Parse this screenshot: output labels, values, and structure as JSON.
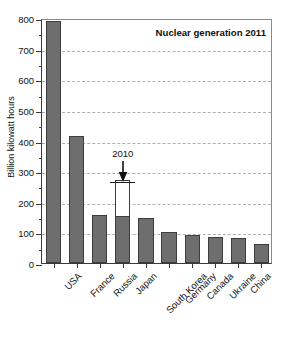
{
  "chart_data": {
    "type": "bar",
    "title": "Nuclear generation 2011",
    "xlabel": "",
    "ylabel": "Billion kilowatt hours",
    "ylim": [
      0,
      800
    ],
    "ytick_step": 100,
    "yminor_step": 50,
    "grid": true,
    "legend": "none",
    "categories": [
      "USA",
      "France",
      "Russia",
      "Japan",
      "South Korea",
      "Germany",
      "Canada",
      "Ukraine",
      "China",
      "United Kingdom"
    ],
    "values": [
      790,
      415,
      158,
      152,
      148,
      102,
      90,
      85,
      83,
      62
    ],
    "ytick_labels": [
      "0",
      "100",
      "200",
      "300",
      "400",
      "500",
      "600",
      "700",
      "800"
    ],
    "annotations": [
      {
        "label": "2010",
        "category": "Japan",
        "value": 270,
        "note": "hollow bar outline showing Japan 2010 level with downward arrow"
      }
    ]
  }
}
